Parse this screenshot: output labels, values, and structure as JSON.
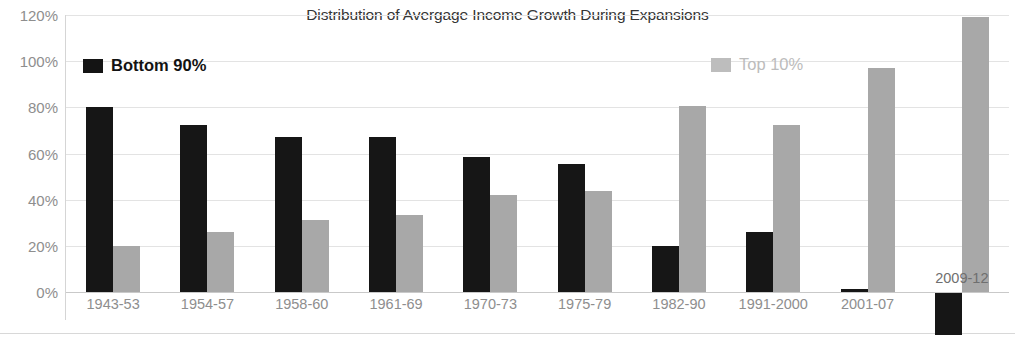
{
  "chart_data": {
    "type": "bar",
    "title": "Distribution of Avergage Income Growth During Expansions",
    "xlabel": "",
    "ylabel": "",
    "ylim": [
      0,
      120
    ],
    "ytick_labels": [
      "120%",
      "100%",
      "80%",
      "60%",
      "40%",
      "20%",
      "0%"
    ],
    "ytick_values": [
      120,
      100,
      80,
      60,
      40,
      20,
      0
    ],
    "grid": true,
    "legend_position": "inside-top",
    "categories": [
      "1943-53",
      "1954-57",
      "1958-60",
      "1961-69",
      "1970-73",
      "1975-79",
      "1982-90",
      "1991-2000",
      "2001-07",
      "2009-12"
    ],
    "series": [
      {
        "name": "Bottom 90%",
        "color": "#161616",
        "values": [
          80.2,
          72.5,
          67.3,
          67.3,
          58.5,
          55.5,
          20.0,
          26.2,
          1.5,
          -18.5
        ]
      },
      {
        "name": "Top 10%",
        "color": "#a8a8a8",
        "values": [
          19.8,
          26.2,
          31.4,
          33.4,
          42.0,
          43.6,
          80.5,
          72.5,
          97.0,
          119.0
        ]
      }
    ]
  },
  "legend": {
    "bottom90_label": "Bottom 90%",
    "top10_label": "Top 10%"
  }
}
